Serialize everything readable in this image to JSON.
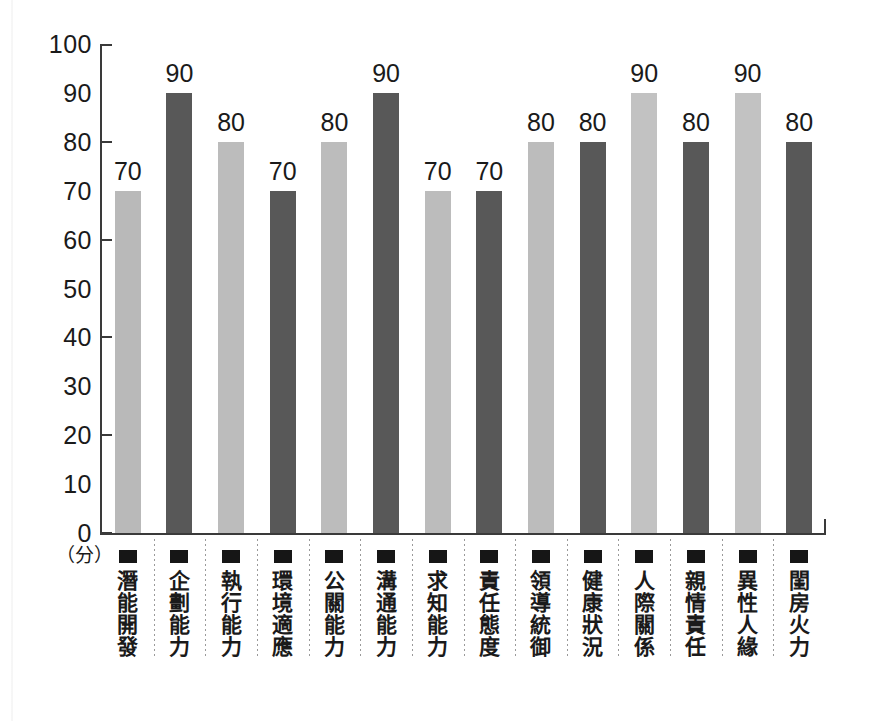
{
  "chart_data": {
    "type": "bar",
    "title": "",
    "subtitle": "",
    "xlabel": "",
    "ylabel": "",
    "unit_label": "（分）",
    "ylim": [
      0,
      100
    ],
    "y_ticks": [
      0,
      10,
      20,
      30,
      40,
      50,
      60,
      70,
      80,
      90,
      100
    ],
    "y_tick_marks": [
      0,
      20,
      40,
      60,
      80,
      100
    ],
    "grid": false,
    "legend": "none",
    "categories": [
      "潛能開發",
      "企劃能力",
      "執行能力",
      "環境適應",
      "公關能力",
      "溝通能力",
      "求知能力",
      "責任態度",
      "領導統御",
      "健康狀況",
      "人際關係",
      "親情責任",
      "異性人緣",
      "閨房火力"
    ],
    "values": [
      70,
      90,
      80,
      70,
      80,
      90,
      70,
      70,
      80,
      80,
      90,
      80,
      90,
      80
    ],
    "bar_colors": [
      "#b9b9b9",
      "#585858",
      "#bcbcbc",
      "#585858",
      "#bcbcbc",
      "#585858",
      "#bcbcbc",
      "#585858",
      "#bcbcbc",
      "#585858",
      "#c2c2c2",
      "#585858",
      "#c2c2c2",
      "#585858"
    ],
    "value_labels": [
      "70",
      "90",
      "80",
      "70",
      "80",
      "90",
      "70",
      "70",
      "80",
      "80",
      "90",
      "80",
      "90",
      "80"
    ],
    "colors": {
      "light_bar": "#bcbcbc",
      "dark_bar": "#585858",
      "axis": "#3a3a3a",
      "text": "#1a1a1a",
      "separator": "#9a9a9a",
      "background": "#ffffff"
    }
  }
}
